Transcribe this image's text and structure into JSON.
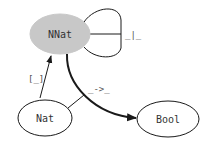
{
  "diagram": {
    "type": "type-graph",
    "colors": {
      "highlight_fill": "#c8c8c8",
      "default_fill": "#ffffff",
      "stroke": "#1a1a1a"
    },
    "nodes": [
      {
        "id": "nnat",
        "label": "NNat",
        "highlighted": true
      },
      {
        "id": "nat",
        "label": "Nat",
        "highlighted": false
      },
      {
        "id": "bool",
        "label": "Bool",
        "highlighted": false
      }
    ],
    "edges": [
      {
        "id": "bottom",
        "from": "nnat",
        "to": "nnat",
        "label": "_|_"
      },
      {
        "id": "embed",
        "from": "nat",
        "to": "nnat",
        "label": "[_]"
      },
      {
        "id": "gt",
        "from": "nat,nnat",
        "to": "bool",
        "label": "_->_"
      }
    ]
  }
}
